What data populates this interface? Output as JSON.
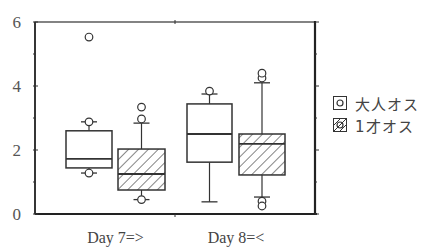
{
  "chart_data": {
    "type": "box",
    "title": "",
    "xlabel": "",
    "ylabel": "",
    "ylim": [
      0,
      6
    ],
    "yticks": [
      0,
      2,
      4,
      6
    ],
    "categories": [
      "Day 7=>",
      "Day 8=<"
    ],
    "legend_position": "right",
    "series": [
      {
        "name": "大人オス",
        "pattern": "open",
        "boxes": [
          {
            "category": "Day 7=>",
            "whisker_low": 1.28,
            "q1": 1.44,
            "median": 1.72,
            "q3": 2.6,
            "whisker_high": 2.88,
            "outliers": [
              1.28,
              2.88,
              5.53
            ]
          },
          {
            "category": "Day 8=<",
            "whisker_low": 0.38,
            "q1": 1.62,
            "median": 2.5,
            "q3": 3.44,
            "whisker_high": 3.75,
            "outliers": [
              3.84
            ]
          }
        ]
      },
      {
        "name": "1才オス",
        "pattern": "hatched",
        "boxes": [
          {
            "category": "Day 7=>",
            "whisker_low": 0.45,
            "q1": 0.75,
            "median": 1.25,
            "q3": 2.03,
            "whisker_high": 2.84,
            "outliers": [
              0.45,
              2.97,
              3.34
            ]
          },
          {
            "category": "Day 8=<",
            "whisker_low": 0.53,
            "q1": 1.22,
            "median": 2.19,
            "q3": 2.5,
            "whisker_high": 4.1,
            "outliers": [
              0.4,
              0.25,
              4.25,
              4.4
            ]
          }
        ]
      }
    ]
  },
  "axis": {
    "y_tick_labels": [
      "0",
      "2",
      "4",
      "6"
    ],
    "x_tick_labels": [
      "Day 7=>",
      "Day 8=<"
    ]
  },
  "legend": {
    "items": [
      {
        "label": "大人オス"
      },
      {
        "label": "1才オス"
      }
    ]
  }
}
